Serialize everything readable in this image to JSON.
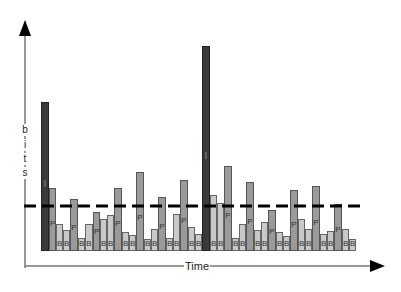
{
  "diagram": {
    "title": "",
    "x_axis_label": "Time",
    "y_axis_label": "bits",
    "y_axis_letters": [
      "b",
      "i",
      "t",
      "s"
    ],
    "average_line": "dashed",
    "frame_types": {
      "I": {
        "label": "I",
        "color": "#3a3a3a"
      },
      "P": {
        "label": "P",
        "color": "#9a9a9a"
      },
      "B": {
        "label": "B",
        "color": "#c9c9c9"
      }
    }
  },
  "chart_data": {
    "type": "bar",
    "title": "",
    "xlabel": "Time",
    "ylabel": "bits",
    "grid": false,
    "legend": null,
    "baseline_px": 251,
    "average_line_px": 206,
    "bars": [
      {
        "type": "I",
        "x": 41,
        "w": 8,
        "top": 102
      },
      {
        "type": "P",
        "x": 49,
        "w": 7,
        "top": 188
      },
      {
        "type": "B",
        "x": 56,
        "w": 7,
        "top": 224
      },
      {
        "type": "B",
        "x": 63,
        "w": 7,
        "top": 230
      },
      {
        "type": "P",
        "x": 70,
        "w": 8,
        "top": 199
      },
      {
        "type": "B",
        "x": 78,
        "w": 7,
        "top": 238
      },
      {
        "type": "B",
        "x": 85,
        "w": 8,
        "top": 224
      },
      {
        "type": "P",
        "x": 93,
        "w": 7,
        "top": 212
      },
      {
        "type": "B",
        "x": 100,
        "w": 7,
        "top": 219
      },
      {
        "type": "B",
        "x": 107,
        "w": 7,
        "top": 215
      },
      {
        "type": "P",
        "x": 114,
        "w": 8,
        "top": 188
      },
      {
        "type": "B",
        "x": 122,
        "w": 7,
        "top": 232
      },
      {
        "type": "B",
        "x": 129,
        "w": 7,
        "top": 235
      },
      {
        "type": "P",
        "x": 136,
        "w": 8,
        "top": 172
      },
      {
        "type": "B",
        "x": 144,
        "w": 7,
        "top": 239
      },
      {
        "type": "B",
        "x": 151,
        "w": 7,
        "top": 229
      },
      {
        "type": "P",
        "x": 158,
        "w": 8,
        "top": 197
      },
      {
        "type": "B",
        "x": 166,
        "w": 7,
        "top": 238
      },
      {
        "type": "B",
        "x": 173,
        "w": 7,
        "top": 214
      },
      {
        "type": "P",
        "x": 180,
        "w": 8,
        "top": 180
      },
      {
        "type": "B",
        "x": 188,
        "w": 7,
        "top": 227
      },
      {
        "type": "B",
        "x": 195,
        "w": 7,
        "top": 234
      },
      {
        "type": "I",
        "x": 202,
        "w": 8,
        "top": 46
      },
      {
        "type": "B",
        "x": 210,
        "w": 7,
        "top": 195
      },
      {
        "type": "B",
        "x": 217,
        "w": 7,
        "top": 203
      },
      {
        "type": "P",
        "x": 224,
        "w": 8,
        "top": 166
      },
      {
        "type": "B",
        "x": 232,
        "w": 7,
        "top": 238
      },
      {
        "type": "B",
        "x": 239,
        "w": 7,
        "top": 224
      },
      {
        "type": "P",
        "x": 246,
        "w": 8,
        "top": 182
      },
      {
        "type": "B",
        "x": 254,
        "w": 7,
        "top": 230
      },
      {
        "type": "B",
        "x": 261,
        "w": 7,
        "top": 222
      },
      {
        "type": "P",
        "x": 268,
        "w": 8,
        "top": 210
      },
      {
        "type": "B",
        "x": 276,
        "w": 7,
        "top": 232
      },
      {
        "type": "B",
        "x": 283,
        "w": 7,
        "top": 236
      },
      {
        "type": "P",
        "x": 290,
        "w": 8,
        "top": 190
      },
      {
        "type": "B",
        "x": 298,
        "w": 7,
        "top": 219
      },
      {
        "type": "B",
        "x": 305,
        "w": 7,
        "top": 229
      },
      {
        "type": "P",
        "x": 312,
        "w": 8,
        "top": 186
      },
      {
        "type": "B",
        "x": 320,
        "w": 7,
        "top": 234
      },
      {
        "type": "B",
        "x": 327,
        "w": 7,
        "top": 231
      },
      {
        "type": "P",
        "x": 334,
        "w": 8,
        "top": 204
      },
      {
        "type": "B",
        "x": 342,
        "w": 7,
        "top": 229
      },
      {
        "type": "B",
        "x": 349,
        "w": 7,
        "top": 239
      }
    ],
    "categories": [
      "I",
      "P",
      "B",
      "B",
      "P",
      "B",
      "B",
      "P",
      "B",
      "B",
      "P",
      "B",
      "B",
      "P",
      "B",
      "B",
      "P",
      "B",
      "B",
      "P",
      "B",
      "B",
      "I",
      "B",
      "B",
      "P",
      "B",
      "B",
      "P",
      "B",
      "B",
      "P",
      "B",
      "B",
      "P",
      "B",
      "B",
      "P",
      "B",
      "B",
      "P",
      "B",
      "B"
    ],
    "values": [
      149,
      63,
      27,
      21,
      52,
      13,
      27,
      39,
      32,
      36,
      63,
      19,
      16,
      79,
      12,
      22,
      54,
      13,
      37,
      71,
      24,
      17,
      205,
      56,
      48,
      85,
      13,
      27,
      69,
      21,
      29,
      41,
      19,
      15,
      61,
      32,
      22,
      65,
      17,
      20,
      47,
      22,
      12
    ],
    "average_value": 45
  }
}
